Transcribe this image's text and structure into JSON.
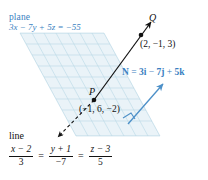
{
  "figure": {
    "type": "geometry-diagram",
    "background_color": "#ffffff"
  },
  "plane": {
    "caption_label": "plane",
    "equation": "3x − 7y + 5z = −55",
    "equation_parts": {
      "lhs": "3x − 7y + 5z",
      "rhs": "−55"
    },
    "fill_color": "#eaf3f8",
    "grid_color": "#b9d8e6",
    "edge_color": "#cfe3ee"
  },
  "points": {
    "Q": {
      "letter": "Q",
      "coords_text": "(2, −1, 3)",
      "x": 2,
      "y": -1,
      "z": 3,
      "dot_color": "#111111"
    },
    "P": {
      "letter": "P",
      "coords_text": "(−1, 6, −2)",
      "x": -1,
      "y": 6,
      "z": -2,
      "dot_color": "#111111"
    }
  },
  "normal_vector": {
    "label_prefix": "N",
    "equals": "=",
    "i_term": "3i",
    "minus": "−",
    "j_term": "7j",
    "plus": "+",
    "k_term": "5k",
    "full_text": "N = 3i − 7j + 5k",
    "color": "#3a7fc1",
    "components": [
      3,
      -7,
      5
    ]
  },
  "line": {
    "caption_label": "line",
    "symmetric_equation": "(x − 2)/3 = (y + 1)/−7 = (z − 3)/5",
    "fractions": [
      {
        "numerator": "x − 2",
        "denominator": "3"
      },
      {
        "numerator": "y + 1",
        "denominator": "−7"
      },
      {
        "numerator": "z − 3",
        "denominator": "5"
      }
    ],
    "equals_signs": [
      "=",
      "="
    ],
    "color": "#111111",
    "direction_vector": [
      3,
      -7,
      5
    ]
  },
  "annotations": {
    "right_angle_marker": "right-angle",
    "solid_ray_direction": "up-right toward Q",
    "dashed_ray_direction": "down-left away from P"
  },
  "colors": {
    "blue_text": "#3a7fc1",
    "blue_arrow": "#4d90c8",
    "black": "#111111",
    "plane_fill": "#eaf3f8",
    "plane_grid": "#b9d8e6"
  }
}
